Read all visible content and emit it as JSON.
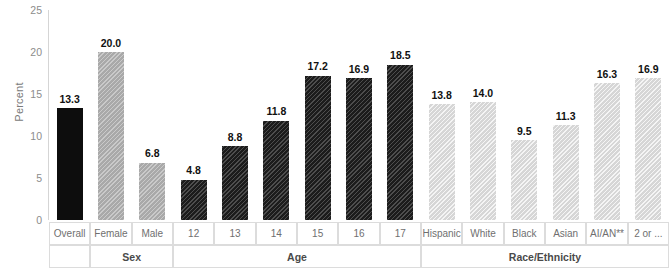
{
  "chart_data": {
    "type": "bar",
    "title": "",
    "xlabel": "",
    "ylabel": "Percent",
    "ylim": [
      0,
      25
    ],
    "yticks": [
      "0",
      "5",
      "10",
      "15",
      "20",
      "25"
    ],
    "grid": false,
    "legend": false,
    "categories": [
      "Overall",
      "Female",
      "Male",
      "12",
      "13",
      "14",
      "15",
      "16",
      "17",
      "Hispanic",
      "White",
      "Black",
      "Asian",
      "AI/AN**",
      "2 or ..."
    ],
    "values": [
      13.3,
      20.0,
      6.8,
      4.8,
      8.8,
      11.8,
      17.2,
      16.9,
      18.5,
      13.8,
      14.0,
      9.5,
      11.3,
      16.3,
      16.9
    ],
    "value_labels": [
      "13.3",
      "20.0",
      "6.8",
      "4.8",
      "8.8",
      "11.8",
      "17.2",
      "16.9",
      "18.5",
      "13.8",
      "14.0",
      "9.5",
      "11.3",
      "16.3",
      "16.9"
    ],
    "group_of_bar": [
      "",
      "Sex",
      "Sex",
      "Age",
      "Age",
      "Age",
      "Age",
      "Age",
      "Age",
      "Race/Ethnicity",
      "Race/Ethnicity",
      "Race/Ethnicity",
      "Race/Ethnicity",
      "Race/Ethnicity",
      "Race/Ethnicity"
    ],
    "groups": [
      {
        "label": "",
        "start": 0,
        "span": 1
      },
      {
        "label": "Sex",
        "start": 1,
        "span": 2
      },
      {
        "label": "Age",
        "start": 3,
        "span": 6
      },
      {
        "label": "Race/Ethnicity",
        "start": 9,
        "span": 6
      }
    ],
    "series_styles": {
      "overall": "#0d0d0d",
      "sex": "#a9a9a9",
      "age": "#1c1c1c",
      "race": "#d6d6d6"
    }
  }
}
